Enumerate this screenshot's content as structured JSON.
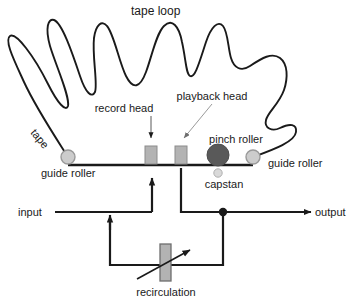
{
  "diagram": {
    "title": "tape loop",
    "labels": {
      "tape": "tape",
      "guide_roller_left": "guide roller",
      "guide_roller_right": "guide roller",
      "record_head": "record head",
      "playback_head": "playback head",
      "pinch_roller": "pinch roller",
      "capstan": "capstan",
      "input": "input",
      "output": "output",
      "recirculation": "recirculation"
    },
    "colors": {
      "line": "#1a1a1a",
      "background": "#ffffff",
      "head_fill": "#b3b3b3",
      "head_stroke": "#808080",
      "pinch_roller_fill": "#595959",
      "roller_fill": "#cccccc",
      "roller_stroke": "#999999",
      "capstan_fill": "#d9d9d9",
      "attenuator_fill": "#b3b3b3",
      "leader_line": "#808080",
      "text": "#1a1a1a"
    },
    "components": [
      {
        "name": "tape-loop-curve",
        "kind": "path"
      },
      {
        "name": "guide-roller-left",
        "kind": "circle",
        "cx": 68,
        "cy": 157,
        "r": 7
      },
      {
        "name": "guide-roller-right",
        "kind": "circle",
        "cx": 253,
        "cy": 157,
        "r": 7
      },
      {
        "name": "record-head",
        "kind": "rect",
        "x": 145,
        "y": 145,
        "w": 12,
        "h": 19
      },
      {
        "name": "playback-head",
        "kind": "rect",
        "x": 175,
        "y": 145,
        "w": 12,
        "h": 19
      },
      {
        "name": "pinch-roller",
        "kind": "circle",
        "cx": 218,
        "cy": 157,
        "r": 11
      },
      {
        "name": "capstan",
        "kind": "circle",
        "cx": 218,
        "cy": 172,
        "r": 4
      },
      {
        "name": "attenuator",
        "kind": "rect",
        "x": 160,
        "y": 240,
        "w": 11,
        "h": 38
      }
    ]
  }
}
